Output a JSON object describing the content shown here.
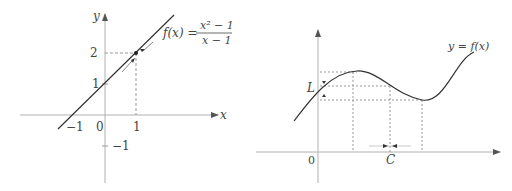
{
  "left_figure": {
    "axis_x_label": "x",
    "axis_y_label": "y",
    "function_lhs": "f(x) =",
    "function_numerator": "x² − 1",
    "function_denominator": "x − 1",
    "tick_x_neg1": "−1",
    "tick_x_0": "0",
    "tick_x_1": "1",
    "tick_y_1": "1",
    "tick_y_2": "2",
    "tick_y_neg1": "−1",
    "hole_point": {
      "x": 1,
      "y": 2
    },
    "line": "y = x + 1"
  },
  "right_figure": {
    "curve_label": "y = f(x)",
    "limit_label": "L",
    "point_label": "C",
    "origin_label": "0"
  },
  "colors": {
    "axis": "#b0b0b0",
    "curve": "#333333",
    "dashed": "#999999",
    "text": "#444444"
  }
}
